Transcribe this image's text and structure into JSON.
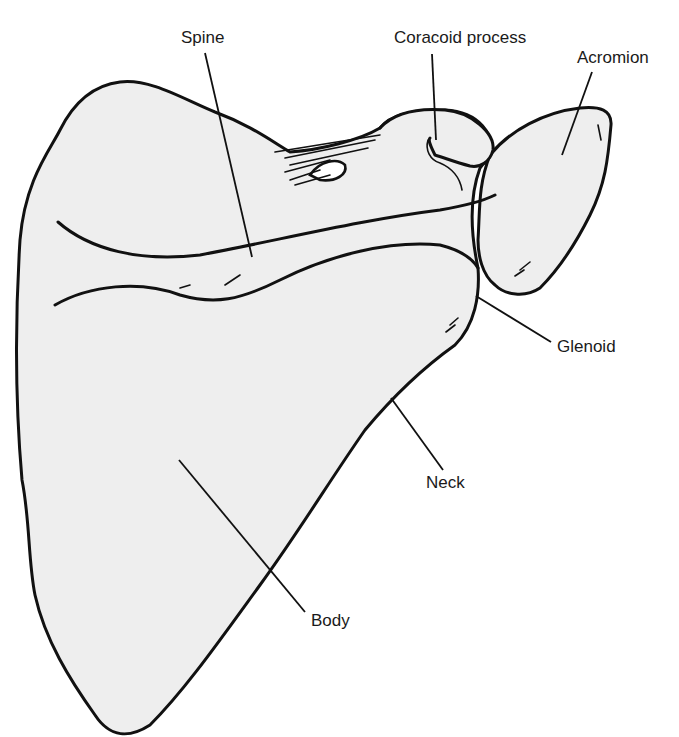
{
  "diagram": {
    "background": "#ffffff",
    "bone_fill": "#eeeeee",
    "line_color": "#111111",
    "labels": {
      "spine": "Spine",
      "coracoid": "Coracoid process",
      "acromion": "Acromion",
      "glenoid": "Glenoid",
      "neck": "Neck",
      "body": "Body"
    }
  }
}
